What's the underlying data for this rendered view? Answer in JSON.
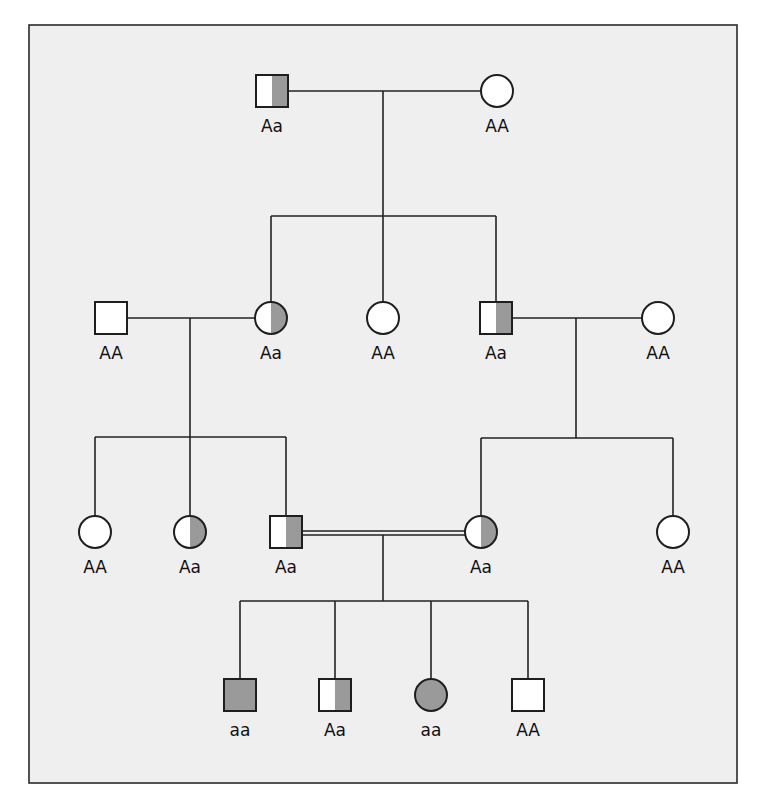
{
  "colors": {
    "background": "#efefef",
    "affected_fill": "#9a9a9a",
    "unaffected_fill": "#ffffff",
    "line": "#222222"
  },
  "frame": {
    "x": 29,
    "y": 25,
    "width": 708,
    "height": 758
  },
  "symbol_size": 32,
  "individuals": [
    {
      "id": "I-1",
      "generation": "I",
      "sex": "male",
      "status": "carrier",
      "genotype": "Aa",
      "cx": 272,
      "cy": 91
    },
    {
      "id": "I-2",
      "generation": "I",
      "sex": "female",
      "status": "unaffected",
      "genotype": "AA",
      "cx": 497,
      "cy": 91
    },
    {
      "id": "II-1",
      "generation": "II",
      "sex": "male",
      "status": "unaffected",
      "genotype": "AA",
      "cx": 111,
      "cy": 318
    },
    {
      "id": "II-2",
      "generation": "II",
      "sex": "female",
      "status": "carrier",
      "genotype": "Aa",
      "cx": 271,
      "cy": 318
    },
    {
      "id": "II-3",
      "generation": "II",
      "sex": "female",
      "status": "unaffected",
      "genotype": "AA",
      "cx": 383,
      "cy": 318
    },
    {
      "id": "II-4",
      "generation": "II",
      "sex": "male",
      "status": "carrier",
      "genotype": "Aa",
      "cx": 496,
      "cy": 318
    },
    {
      "id": "II-5",
      "generation": "II",
      "sex": "female",
      "status": "unaffected",
      "genotype": "AA",
      "cx": 658,
      "cy": 318
    },
    {
      "id": "III-1",
      "generation": "III",
      "sex": "female",
      "status": "unaffected",
      "genotype": "AA",
      "cx": 95,
      "cy": 532
    },
    {
      "id": "III-2",
      "generation": "III",
      "sex": "female",
      "status": "carrier",
      "genotype": "Aa",
      "cx": 190,
      "cy": 532
    },
    {
      "id": "III-3",
      "generation": "III",
      "sex": "male",
      "status": "carrier",
      "genotype": "Aa",
      "cx": 286,
      "cy": 532
    },
    {
      "id": "III-4",
      "generation": "III",
      "sex": "female",
      "status": "carrier",
      "genotype": "Aa",
      "cx": 481,
      "cy": 532
    },
    {
      "id": "III-5",
      "generation": "III",
      "sex": "female",
      "status": "unaffected",
      "genotype": "AA",
      "cx": 673,
      "cy": 532
    },
    {
      "id": "IV-1",
      "generation": "IV",
      "sex": "male",
      "status": "affected",
      "genotype": "aa",
      "cx": 240,
      "cy": 695
    },
    {
      "id": "IV-2",
      "generation": "IV",
      "sex": "male",
      "status": "carrier",
      "genotype": "Aa",
      "cx": 335,
      "cy": 695
    },
    {
      "id": "IV-3",
      "generation": "IV",
      "sex": "female",
      "status": "affected",
      "genotype": "aa",
      "cx": 431,
      "cy": 695
    },
    {
      "id": "IV-4",
      "generation": "IV",
      "sex": "male",
      "status": "unaffected",
      "genotype": "AA",
      "cx": 528,
      "cy": 695
    }
  ],
  "matings": [
    {
      "id": "mating-I",
      "from": "I-1",
      "to": "I-2",
      "y": 91,
      "consanguineous": false,
      "drop_x": 383,
      "drop_to_y": 216
    },
    {
      "id": "mating-II-a",
      "from": "II-1",
      "to": "II-2",
      "y": 318,
      "consanguineous": false,
      "drop_x": 190,
      "drop_to_y": 437
    },
    {
      "id": "mating-II-b",
      "from": "II-4",
      "to": "II-5",
      "y": 318,
      "consanguineous": false,
      "drop_x": 576,
      "drop_to_y": 438
    },
    {
      "id": "mating-III",
      "from": "III-3",
      "to": "III-4",
      "y": 533,
      "consanguineous": true,
      "drop_x": 383,
      "drop_to_y": 601
    }
  ],
  "sibships": [
    {
      "id": "sibship-II",
      "y": 216,
      "children": [
        "II-2",
        "II-3",
        "II-4"
      ]
    },
    {
      "id": "sibship-III-a",
      "y": 437,
      "children": [
        "III-1",
        "III-2",
        "III-3"
      ]
    },
    {
      "id": "sibship-III-b",
      "y": 438,
      "children": [
        "III-4",
        "III-5"
      ]
    },
    {
      "id": "sibship-IV",
      "y": 601,
      "children": [
        "IV-1",
        "IV-2",
        "IV-3",
        "IV-4"
      ]
    }
  ],
  "legend_meaning": {
    "unaffected": "open symbol (AA)",
    "carrier": "half-shaded symbol (Aa)",
    "affected": "fully shaded symbol (aa)"
  }
}
